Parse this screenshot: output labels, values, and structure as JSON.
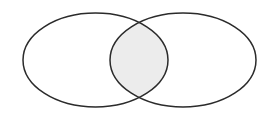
{
  "diagram": {
    "type": "venn",
    "background": "#ffffff",
    "stroke_color": "#2b2b2b",
    "stroke_width": 1.5,
    "intersection_fill": "#ececec",
    "sets": [
      {
        "name": "left-set",
        "cx": 95.5,
        "cy": 60,
        "rx": 72.5,
        "ry": 47,
        "fill": "none"
      },
      {
        "name": "right-set",
        "cx": 183,
        "cy": 60,
        "rx": 73,
        "ry": 47,
        "fill": "none"
      }
    ],
    "intersection": {
      "shaded": true
    }
  }
}
